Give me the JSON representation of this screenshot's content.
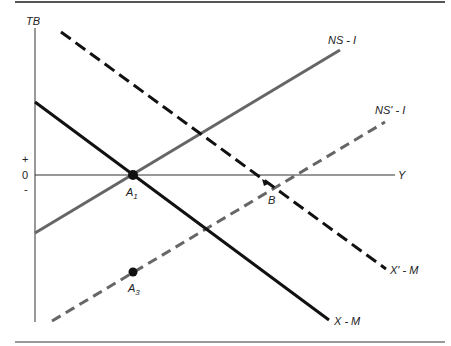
{
  "diagram": {
    "axes": {
      "y_label": "TB",
      "x_label": "Y",
      "plus": "+",
      "zero": "0",
      "minus": "-"
    },
    "curves": [
      {
        "id": "x-m",
        "label": "X - M",
        "style": "solid",
        "color": "#111111"
      },
      {
        "id": "x-prime-m",
        "label": "X' - M",
        "style": "dashed",
        "color": "#111111"
      },
      {
        "id": "ns-i",
        "label": "NS - I",
        "style": "solid",
        "color": "#666666"
      },
      {
        "id": "ns-prime-i",
        "label": "NS' - I",
        "style": "dashed",
        "color": "#666666"
      }
    ],
    "points": [
      {
        "id": "A1",
        "label": "A",
        "sub": "1"
      },
      {
        "id": "B",
        "label": "B"
      },
      {
        "id": "A3",
        "label": "A",
        "sub": "3"
      }
    ]
  }
}
